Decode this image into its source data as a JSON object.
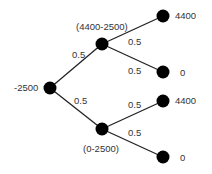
{
  "diagram": {
    "type": "probability-tree",
    "colors": {
      "node": "#000000",
      "edge": "#222222",
      "text": "#333333"
    },
    "nodes": [
      {
        "id": "root",
        "label": "-2500",
        "x": 50,
        "y": 88
      },
      {
        "id": "upper",
        "label": "(4400-2500)",
        "x": 102,
        "y": 44
      },
      {
        "id": "lower",
        "label": "(0-2500)",
        "x": 102,
        "y": 129
      },
      {
        "id": "leaf1",
        "label": "4400",
        "x": 163,
        "y": 16
      },
      {
        "id": "leaf2",
        "label": "0",
        "x": 163,
        "y": 72
      },
      {
        "id": "leaf3",
        "label": "4400",
        "x": 163,
        "y": 101
      },
      {
        "id": "leaf4",
        "label": "0",
        "x": 163,
        "y": 157
      }
    ],
    "edges": [
      {
        "from": "root",
        "to": "upper",
        "prob": "0.5"
      },
      {
        "from": "root",
        "to": "lower",
        "prob": "0.5"
      },
      {
        "from": "upper",
        "to": "leaf1",
        "prob": "0.5"
      },
      {
        "from": "upper",
        "to": "leaf2",
        "prob": "0.5"
      },
      {
        "from": "lower",
        "to": "leaf3",
        "prob": "0.5"
      },
      {
        "from": "lower",
        "to": "leaf4",
        "prob": "0.5"
      }
    ]
  }
}
